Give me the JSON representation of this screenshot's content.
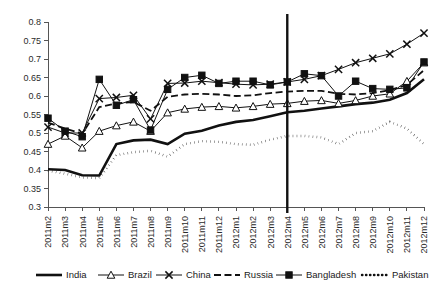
{
  "chart_data": {
    "type": "line",
    "title": "",
    "xlabel": "",
    "ylabel": "",
    "ylim": [
      0.3,
      0.8
    ],
    "ytick_step": 0.05,
    "yticks": [
      "0.3",
      "0.35",
      "0.4",
      "0.45",
      "0.5",
      "0.55",
      "0.6",
      "0.65",
      "0.7",
      "0.75",
      "0.8"
    ],
    "grid": false,
    "legend_position": "bottom",
    "categories": [
      "2011m2",
      "2011m3",
      "2011m4",
      "2011m5",
      "2011m6",
      "2011m7",
      "2011m8",
      "2011m9",
      "2011m10",
      "2011m11",
      "2011m12",
      "2012m1",
      "2012m2",
      "2012m3",
      "2012m4",
      "2012m5",
      "2012m6",
      "2012m7",
      "2012m8",
      "2012m9",
      "2012m10",
      "2012m11",
      "2012m12"
    ],
    "annotations": [
      {
        "type": "vertical-line",
        "at_category": "2012m4",
        "label": ""
      }
    ],
    "series": [
      {
        "name": "India",
        "style": "thick-solid",
        "marker": "none",
        "color": "#111111",
        "values": [
          0.402,
          0.4,
          0.386,
          0.385,
          0.47,
          0.48,
          0.482,
          0.47,
          0.498,
          0.506,
          0.52,
          0.53,
          0.535,
          0.545,
          0.556,
          0.56,
          0.566,
          0.572,
          0.578,
          0.582,
          0.59,
          0.608,
          0.645
        ]
      },
      {
        "name": "Brazil",
        "style": "thin-solid",
        "marker": "triangle-open",
        "color": "#111111",
        "values": [
          0.47,
          0.492,
          0.46,
          0.505,
          0.52,
          0.53,
          0.505,
          0.555,
          0.565,
          0.57,
          0.572,
          0.568,
          0.572,
          0.578,
          0.58,
          0.586,
          0.588,
          0.58,
          0.588,
          0.6,
          0.606,
          0.64,
          0.69
        ]
      },
      {
        "name": "China",
        "style": "thin-solid",
        "marker": "x",
        "color": "#111111",
        "values": [
          0.516,
          0.5,
          0.5,
          0.593,
          0.596,
          0.602,
          0.538,
          0.634,
          0.635,
          0.64,
          0.636,
          0.632,
          0.63,
          0.632,
          0.638,
          0.645,
          0.655,
          0.672,
          0.69,
          0.702,
          0.714,
          0.74,
          0.77
        ]
      },
      {
        "name": "Russia",
        "style": "dashed",
        "marker": "none",
        "color": "#111111",
        "values": [
          0.528,
          0.512,
          0.498,
          0.57,
          0.58,
          0.584,
          0.56,
          0.598,
          0.604,
          0.606,
          0.604,
          0.6,
          0.602,
          0.608,
          0.612,
          0.614,
          0.614,
          0.606,
          0.604,
          0.608,
          0.616,
          0.63,
          0.67
        ]
      },
      {
        "name": "Bangladesh",
        "style": "thin-solid",
        "marker": "square-filled",
        "color": "#111111",
        "values": [
          0.54,
          0.505,
          0.49,
          0.645,
          0.575,
          0.59,
          0.508,
          0.618,
          0.65,
          0.656,
          0.634,
          0.64,
          0.64,
          0.63,
          0.638,
          0.66,
          0.655,
          0.6,
          0.64,
          0.62,
          0.618,
          0.622,
          0.692
        ]
      },
      {
        "name": "Pakistan",
        "style": "dotted",
        "marker": "none",
        "color": "#111111",
        "values": [
          0.398,
          0.39,
          0.38,
          0.378,
          0.44,
          0.448,
          0.452,
          0.436,
          0.47,
          0.478,
          0.476,
          0.47,
          0.468,
          0.482,
          0.492,
          0.492,
          0.488,
          0.47,
          0.5,
          0.505,
          0.53,
          0.512,
          0.47
        ]
      }
    ],
    "legend": [
      {
        "label": "India",
        "style": "thick-solid",
        "marker": "none"
      },
      {
        "label": "Brazil",
        "style": "thin-solid",
        "marker": "triangle-open"
      },
      {
        "label": "China",
        "style": "thin-solid",
        "marker": "x"
      },
      {
        "label": "Russia",
        "style": "dashed",
        "marker": "none"
      },
      {
        "label": "Bangladesh",
        "style": "thin-solid",
        "marker": "square-filled"
      },
      {
        "label": "Pakistan",
        "style": "dotted",
        "marker": "none"
      }
    ]
  }
}
